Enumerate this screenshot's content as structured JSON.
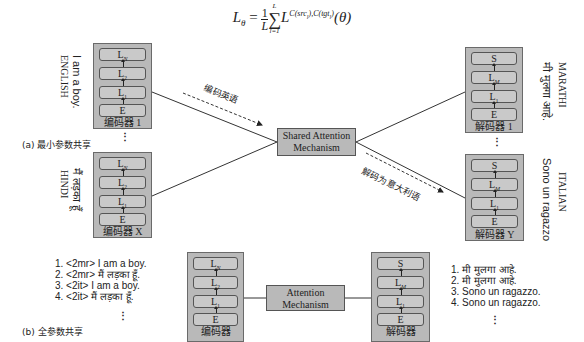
{
  "formula": "L_θ = (1/L) Σ_{l=1}^{L} L^{C(src_l),C(tgt_l)}(θ)",
  "formula_parts": {
    "lhs": "L",
    "lhs_sub": "θ",
    "eq": " = ",
    "frac_num": "1",
    "frac_den": "L",
    "sum": "∑",
    "sum_top": "L",
    "sum_bottom": "l=1",
    "term": "L",
    "term_sup": "C(src",
    "term_sup_sub1": "l",
    "term_sup_mid": "),C(tgt",
    "term_sup_sub2": "l",
    "term_sup_end": ")",
    "arg": "(θ)"
  },
  "part_a": {
    "caption": "(a) 最小参数共享",
    "encoders": [
      {
        "caption": "编码器 1",
        "layers": [
          "L_N",
          "L_2",
          "L_1",
          "E"
        ],
        "language": "ENGLISH",
        "sentence": "I am a boy."
      },
      {
        "caption": "编码器 X",
        "layers": [
          "L_N",
          "L_2",
          "L_1",
          "E"
        ],
        "language": "HINDI",
        "sentence": "मैं लड़का हूँ"
      }
    ],
    "decoders": [
      {
        "caption": "解码器 1",
        "layers": [
          "S",
          "L_M",
          "L_1",
          "E"
        ],
        "language": "MARATHI",
        "sentence": "मी मुलगा आहे."
      },
      {
        "caption": "解码器 Y",
        "layers": [
          "S",
          "L_M",
          "L_1",
          "E"
        ],
        "language": "ITALIAN",
        "sentence": "Sono un ragazzo"
      }
    ],
    "shared_attention": {
      "line1": "Shared Attention",
      "line2": "Mechanism"
    },
    "arrow_encode_label": "编码英语",
    "arrow_decode_label": "解码为意大利语"
  },
  "part_b": {
    "caption": "(b) 全参数共享",
    "encoder": {
      "caption": "编码器",
      "layers": [
        "L_N",
        "L_2",
        "L_1",
        "E"
      ]
    },
    "decoder": {
      "caption": "解码器",
      "layers": [
        "S",
        "L_M",
        "L_1",
        "E"
      ]
    },
    "attention": {
      "line1": "Attention",
      "line2": "Mechanism"
    },
    "inputs": [
      "1. <2mr> I am a boy.",
      "2. <2mr> मैं लड़का हूँ.",
      "3. <2it> I am a boy.",
      "4. <2it> मैं लड़का हूँ."
    ],
    "outputs": [
      "1. मी मुलगा आहे.",
      "2. मी मुलगा आहे.",
      "3. Sono un ragazzo.",
      "4. Sono un ragazzo."
    ]
  },
  "ellipsis": "⋮",
  "colors": {
    "box_fill": "#b9b9b9",
    "layer_fill": "#c9c9c9",
    "border": "#555555",
    "line": "#333333"
  }
}
